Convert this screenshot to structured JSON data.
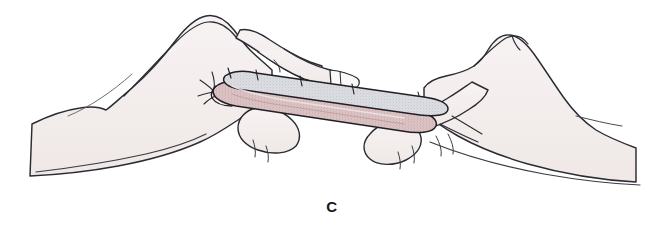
{
  "figure": {
    "panel_label": "C",
    "caption_position": "bottom-center",
    "background_color": "#ffffff",
    "illustration_style": "medical-line-drawing"
  },
  "palette": {
    "background": "#ffffff",
    "skin_fill": "#f4efee",
    "skin_fill_shadow": "#ece5e4",
    "outline": "#2b2b33",
    "outline_soft": "#4a4a55",
    "graft_top_fill": "#d9dade",
    "graft_top_speckle": "#b6b9c2",
    "graft_body_fill": "#d8bfc0",
    "graft_body_speckle": "#bd9ea0",
    "graft_edge": "#221f24",
    "nail_fill": "#fbf8f8"
  },
  "elements": {
    "left_hand_name": "left-hand",
    "right_hand_name": "right-hand",
    "graft_name": "tissue-graft",
    "left_index_finger": "left-index-finger",
    "right_index_finger": "right-index-finger",
    "left_thumb": "left-thumb",
    "right_thumb": "right-thumb"
  }
}
